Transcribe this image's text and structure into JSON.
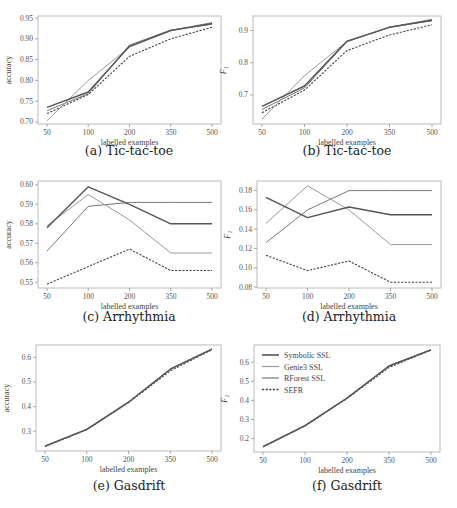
{
  "colors": {
    "symbolic": "#555555",
    "genie3": "#9a9a9a",
    "rforest": "#777777",
    "sefr": "#444444",
    "frame": "#aaaaaa"
  },
  "legend": {
    "entries": [
      {
        "label": "Symbolic SSL",
        "style": "solid"
      },
      {
        "label": "Genie3 SSL",
        "style": "solid"
      },
      {
        "label": "RForest SSL",
        "style": "solid"
      },
      {
        "label": "SEFR",
        "style": "dashed"
      }
    ]
  },
  "captions": {
    "a": "(a) Tic-tac-toe",
    "b": "(b) Tic-tac-toe",
    "c": "(c) Arrhythmia",
    "d": "(d) Arrhythmia",
    "e": "(e) Gasdrift",
    "f": "(f) Gasdrift"
  },
  "chart_data": [
    {
      "id": "a",
      "type": "line",
      "title": "(a) Tic-tac-toe",
      "xlabel": "labelled examples",
      "ylabel": "accuracy",
      "x": [
        50,
        100,
        200,
        350,
        500
      ],
      "ylim": [
        0.695,
        0.955
      ],
      "yticks": [
        0.7,
        0.75,
        0.8,
        0.85,
        0.9,
        0.95
      ],
      "ytick_labels": [
        "0.70",
        "0.75",
        "0.80",
        "0.85",
        "0.90",
        "0.95"
      ],
      "grid": false,
      "legend": false,
      "series": [
        {
          "name": "Symbolic SSL",
          "values": [
            0.735,
            0.772,
            0.882,
            0.92,
            0.937
          ]
        },
        {
          "name": "Genie3 SSL",
          "values": [
            0.703,
            0.8,
            0.88,
            0.92,
            0.939
          ]
        },
        {
          "name": "RForest SSL",
          "values": [
            0.727,
            0.768,
            0.885,
            0.921,
            0.935
          ]
        },
        {
          "name": "SEFR",
          "values": [
            0.72,
            0.766,
            0.858,
            0.9,
            0.928
          ]
        }
      ]
    },
    {
      "id": "b",
      "type": "line",
      "title": "(b) Tic-tac-toe",
      "xlabel": "labelled examples",
      "ylabel": "F1",
      "x": [
        50,
        100,
        200,
        350,
        500
      ],
      "ylim": [
        0.61,
        0.945
      ],
      "yticks": [
        0.7,
        0.8,
        0.9
      ],
      "ytick_labels": [
        "0.7",
        "0.8",
        "0.9"
      ],
      "grid": false,
      "legend": false,
      "series": [
        {
          "name": "Symbolic SSL",
          "values": [
            0.665,
            0.728,
            0.867,
            0.91,
            0.932
          ]
        },
        {
          "name": "Genie3 SSL",
          "values": [
            0.625,
            0.76,
            0.866,
            0.91,
            0.935
          ]
        },
        {
          "name": "RForest SSL",
          "values": [
            0.655,
            0.722,
            0.865,
            0.911,
            0.93
          ]
        },
        {
          "name": "SEFR",
          "values": [
            0.645,
            0.715,
            0.838,
            0.886,
            0.918
          ]
        }
      ]
    },
    {
      "id": "c",
      "type": "line",
      "title": "(c) Arrhythmia",
      "xlabel": "labelled examples",
      "ylabel": "accuracy",
      "x": [
        50,
        100,
        200,
        350,
        500
      ],
      "ylim": [
        0.547,
        0.602
      ],
      "yticks": [
        0.55,
        0.56,
        0.57,
        0.58,
        0.59,
        0.6
      ],
      "ytick_labels": [
        "0.55",
        "0.56",
        "0.57",
        "0.58",
        "0.59",
        "0.60"
      ],
      "grid": false,
      "legend": false,
      "series": [
        {
          "name": "Symbolic SSL",
          "values": [
            0.578,
            0.599,
            0.59,
            0.58,
            0.58
          ]
        },
        {
          "name": "Genie3 SSL",
          "values": [
            0.579,
            0.595,
            0.582,
            0.565,
            0.565
          ]
        },
        {
          "name": "RForest SSL",
          "values": [
            0.566,
            0.589,
            0.591,
            0.591,
            0.591
          ]
        },
        {
          "name": "SEFR",
          "values": [
            0.549,
            0.558,
            0.567,
            0.556,
            0.556
          ]
        }
      ]
    },
    {
      "id": "d",
      "type": "line",
      "title": "(d) Arrhythmia",
      "xlabel": "labelled examples",
      "ylabel": "F1",
      "x": [
        50,
        100,
        200,
        350,
        500
      ],
      "ylim": [
        0.079,
        0.19
      ],
      "yticks": [
        0.08,
        0.1,
        0.12,
        0.14,
        0.16,
        0.18
      ],
      "ytick_labels": [
        "0.08",
        "0.10",
        "0.12",
        "0.14",
        "0.16",
        "0.18"
      ],
      "grid": false,
      "legend": false,
      "series": [
        {
          "name": "Symbolic SSL",
          "values": [
            0.173,
            0.152,
            0.163,
            0.155,
            0.155
          ]
        },
        {
          "name": "Genie3 SSL",
          "values": [
            0.146,
            0.185,
            0.16,
            0.124,
            0.124
          ]
        },
        {
          "name": "RForest SSL",
          "values": [
            0.126,
            0.16,
            0.18,
            0.18,
            0.18
          ]
        },
        {
          "name": "SEFR",
          "values": [
            0.113,
            0.097,
            0.107,
            0.085,
            0.085
          ]
        }
      ]
    },
    {
      "id": "e",
      "type": "line",
      "title": "(e) Gasdrift",
      "xlabel": "labelled examples",
      "ylabel": "accuracy",
      "x": [
        50,
        100,
        200,
        350,
        500
      ],
      "ylim": [
        0.22,
        0.65
      ],
      "yticks": [
        0.3,
        0.4,
        0.5,
        0.6
      ],
      "ytick_labels": [
        "0.3",
        "0.4",
        "0.5",
        "0.6"
      ],
      "grid": false,
      "legend": false,
      "series": [
        {
          "name": "Symbolic SSL",
          "values": [
            0.24,
            0.308,
            0.418,
            0.552,
            0.633
          ]
        },
        {
          "name": "Genie3 SSL",
          "values": [
            0.241,
            0.309,
            0.417,
            0.55,
            0.632
          ]
        },
        {
          "name": "RForest SSL",
          "values": [
            0.239,
            0.307,
            0.419,
            0.553,
            0.634
          ]
        },
        {
          "name": "SEFR",
          "values": [
            0.238,
            0.306,
            0.416,
            0.545,
            0.631
          ]
        }
      ]
    },
    {
      "id": "f",
      "type": "line",
      "title": "(f) Gasdrift",
      "xlabel": "labelled examples",
      "ylabel": "F1",
      "x": [
        50,
        100,
        200,
        350,
        500
      ],
      "ylim": [
        0.13,
        0.69
      ],
      "yticks": [
        0.2,
        0.3,
        0.4,
        0.5,
        0.6
      ],
      "ytick_labels": [
        "0.2",
        "0.3",
        "0.4",
        "0.5",
        "0.6"
      ],
      "grid": false,
      "legend": true,
      "legend_position": "upper left",
      "series": [
        {
          "name": "Symbolic SSL",
          "values": [
            0.158,
            0.268,
            0.412,
            0.58,
            0.665
          ]
        },
        {
          "name": "Genie3 SSL",
          "values": [
            0.159,
            0.269,
            0.411,
            0.578,
            0.664
          ]
        },
        {
          "name": "RForest SSL",
          "values": [
            0.157,
            0.267,
            0.413,
            0.581,
            0.666
          ]
        },
        {
          "name": "SEFR",
          "values": [
            0.156,
            0.266,
            0.41,
            0.572,
            0.663
          ]
        }
      ]
    }
  ]
}
